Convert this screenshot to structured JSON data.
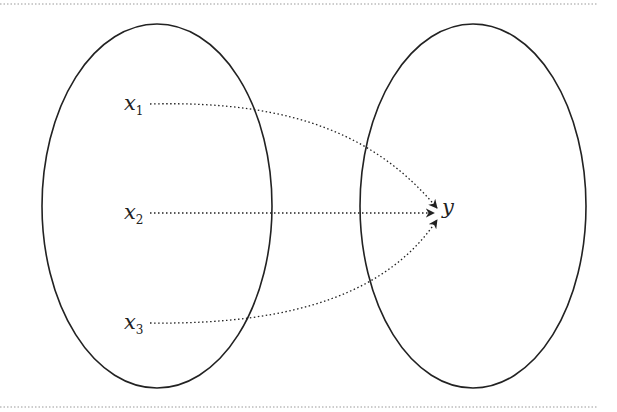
{
  "diagram": {
    "title": "",
    "colors": {
      "stroke": "#222222",
      "background": "#ffffff"
    },
    "separators": {
      "top_y": 4,
      "bottom_y": 407,
      "style": "dotted"
    },
    "sets": [
      {
        "id": "domain",
        "shape": "ellipse",
        "cx": 157,
        "cy": 206,
        "rx": 115,
        "ry": 182
      },
      {
        "id": "codomain",
        "shape": "ellipse",
        "cx": 473,
        "cy": 206,
        "rx": 113,
        "ry": 182
      }
    ],
    "nodes": [
      {
        "id": "x1",
        "label": "x",
        "subscript": "1",
        "x": 124,
        "y": 110
      },
      {
        "id": "x2",
        "label": "x",
        "subscript": "2",
        "x": 124,
        "y": 219
      },
      {
        "id": "x3",
        "label": "x",
        "subscript": "3",
        "x": 124,
        "y": 329
      },
      {
        "id": "y",
        "label": "y",
        "subscript": "",
        "x": 442,
        "y": 214
      }
    ],
    "edges": [
      {
        "from": "x1",
        "to": "y",
        "style": "dotted",
        "curve": "arc-down"
      },
      {
        "from": "x2",
        "to": "y",
        "style": "dotted",
        "curve": "straight"
      },
      {
        "from": "x3",
        "to": "y",
        "style": "dotted",
        "curve": "arc-up"
      }
    ]
  }
}
